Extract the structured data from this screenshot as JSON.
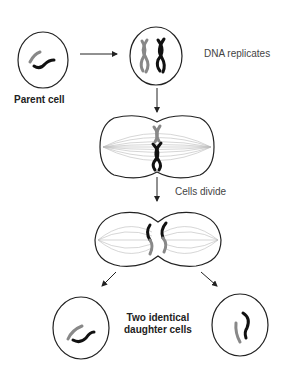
{
  "diagram": {
    "labels": {
      "parent_cell": "Parent cell",
      "dna_replicates": "DNA replicates",
      "cells_divide": "Cells divide",
      "daughter_line1": "Two identical",
      "daughter_line2": "daughter cells"
    },
    "colors": {
      "outline": "#222222",
      "chromosome_dark": "#111111",
      "chromosome_light": "#888888",
      "spindle": "#bbbbbb",
      "text": "#333333"
    },
    "stages": [
      {
        "id": "parent",
        "label": "Parent cell"
      },
      {
        "id": "replication",
        "label": "DNA replicates"
      },
      {
        "id": "metaphase",
        "label": ""
      },
      {
        "id": "division",
        "label": "Cells divide"
      },
      {
        "id": "daughters",
        "label": "Two identical daughter cells"
      }
    ]
  }
}
